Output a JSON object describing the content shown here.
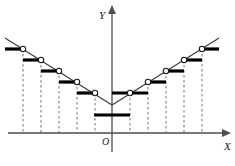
{
  "figure": {
    "background_color": "#ffffff",
    "line_color": "#404040",
    "step_color": "#000000",
    "axis_color": "#4d4d4d",
    "dash_color": "#808080",
    "marker_fill": "#ffffff",
    "marker_stroke": "#1a1a1a"
  },
  "axes": {
    "x_label": "X",
    "y_label": "Y",
    "origin_label": "O",
    "x_axis": {
      "x1": 8,
      "y1": 133,
      "x2": 222,
      "y2": 133,
      "arrow": "right"
    },
    "y_axis": {
      "x1": 112,
      "y1": 152,
      "x2": 112,
      "y2": 14,
      "arrow": "up"
    },
    "x_label_pos": {
      "x": 224,
      "y": 150
    },
    "y_label_pos": {
      "x": 99,
      "y": 19
    },
    "origin_label_pos": {
      "x": 102,
      "y": 145
    }
  },
  "chart_data": {
    "type": "line",
    "title": "",
    "xlabel": "X",
    "ylabel": "Y",
    "grid": "dashed-vertical",
    "legend": "none",
    "vertex": {
      "x": 112,
      "y": 105
    },
    "diagonal_left": {
      "x1": 5,
      "y1": 38,
      "x2": 112,
      "y2": 105
    },
    "diagonal_right": {
      "x1": 112,
      "y1": 105,
      "x2": 219,
      "y2": 38
    },
    "gridlines_x": [
      23,
      41,
      59,
      77,
      95,
      130,
      148,
      166,
      184,
      202
    ],
    "gridline_top_y": [
      49,
      60,
      71,
      82,
      93,
      93,
      82,
      71,
      60,
      49
    ],
    "gridline_bottom_y": 133,
    "steps": [
      {
        "id": "step-l5",
        "x1": 5,
        "x2": 23,
        "y": 49,
        "circle_x": 23,
        "circle_side": "right"
      },
      {
        "id": "step-l4",
        "x1": 23,
        "x2": 41,
        "y": 60,
        "circle_x": 41,
        "circle_side": "right"
      },
      {
        "id": "step-l3",
        "x1": 41,
        "x2": 59,
        "y": 71,
        "circle_x": 59,
        "circle_side": "right"
      },
      {
        "id": "step-l2",
        "x1": 59,
        "x2": 77,
        "y": 82,
        "circle_x": 77,
        "circle_side": "right"
      },
      {
        "id": "step-l1",
        "x1": 77,
        "x2": 95,
        "y": 93,
        "circle_x": 95,
        "circle_side": "right"
      },
      {
        "id": "step-c0",
        "x1": 94,
        "x2": 130,
        "y": 115,
        "circle_x": null,
        "circle_side": "none"
      },
      {
        "id": "step-r1",
        "x1": 112,
        "x2": 148,
        "y": 93,
        "circle_x": 130,
        "circle_side": "left"
      },
      {
        "id": "step-r2",
        "x1": 148,
        "x2": 166,
        "y": 82,
        "circle_x": 148,
        "circle_side": "left"
      },
      {
        "id": "step-r3",
        "x1": 166,
        "x2": 184,
        "y": 71,
        "circle_x": 166,
        "circle_side": "left"
      },
      {
        "id": "step-r4",
        "x1": 184,
        "x2": 202,
        "y": 60,
        "circle_x": 184,
        "circle_side": "left"
      },
      {
        "id": "step-r5",
        "x1": 202,
        "x2": 219,
        "y": 49,
        "circle_x": 202,
        "circle_side": "left"
      }
    ],
    "open_circles": [
      {
        "x": 23,
        "y": 49
      },
      {
        "x": 41,
        "y": 60
      },
      {
        "x": 59,
        "y": 71
      },
      {
        "x": 77,
        "y": 82
      },
      {
        "x": 95,
        "y": 93
      },
      {
        "x": 130,
        "y": 93
      },
      {
        "x": 148,
        "y": 82
      },
      {
        "x": 166,
        "y": 71
      },
      {
        "x": 184,
        "y": 60
      },
      {
        "x": 202,
        "y": 49
      }
    ]
  }
}
